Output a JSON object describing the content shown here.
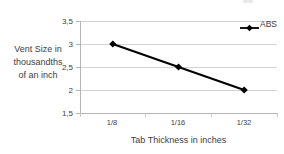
{
  "chart_data": {
    "type": "line",
    "title": "",
    "xlabel": "Tab Thickness in inches",
    "ylabel": "Vent Size in thousandths of an inch",
    "ylabel_lines": [
      "Vent Size in",
      "thousandths",
      "of an inch"
    ],
    "categories": [
      "1/8",
      "1/16",
      "1/32"
    ],
    "series": [
      {
        "name": "ABS",
        "values": [
          3,
          2.5,
          2
        ],
        "color": "#000000",
        "marker": "diamond"
      }
    ],
    "ylim": [
      1.5,
      3.5
    ],
    "y_ticks": [
      1.5,
      2,
      2.5,
      3,
      3.5
    ],
    "y_tick_labels": [
      "1,5",
      "2",
      "2,5",
      "3",
      "3,5"
    ],
    "x_tick_labels": [
      "1/8",
      "1/16",
      "1/32"
    ],
    "grid": "horizontal",
    "legend": {
      "position": "top-right",
      "entries": [
        "ABS"
      ]
    },
    "decimal_separator": ","
  },
  "colors": {
    "series": "#000000",
    "gridline": "#d4d4d4",
    "axis": "#b5b5b5",
    "text": "#404040",
    "background": "#ffffff"
  }
}
